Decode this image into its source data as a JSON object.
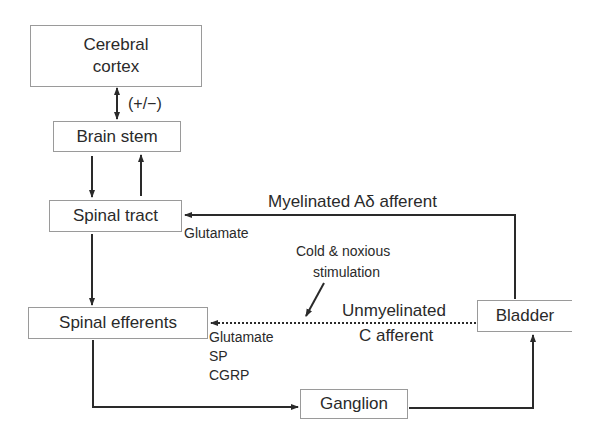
{
  "diagram": {
    "nodes": {
      "cerebral_cortex": {
        "label_line1": "Cerebral",
        "label_line2": "cortex"
      },
      "brain_stem": {
        "label": "Brain stem"
      },
      "spinal_tract": {
        "label": "Spinal tract"
      },
      "spinal_efferents": {
        "label": "Spinal efferents"
      },
      "bladder": {
        "label": "Bladder"
      },
      "ganglion": {
        "label": "Ganglion"
      }
    },
    "annotations": {
      "modulation": "(+/−)",
      "myelinated": "Myelinated Aδ afferent",
      "glutamate_tract": "Glutamate",
      "cold_line1": "Cold & noxious",
      "cold_line2": "stimulation",
      "unmyelinated_line1": "Unmyelinated",
      "unmyelinated_line2": "C afferent",
      "neurotransmitters": [
        "Glutamate",
        "SP",
        "CGRP"
      ]
    },
    "edges": [
      {
        "from": "cerebral_cortex",
        "to": "brain_stem",
        "style": "solid",
        "direction": "bidirectional",
        "label": "(+/−)"
      },
      {
        "from": "brain_stem",
        "to": "spinal_tract",
        "style": "solid"
      },
      {
        "from": "spinal_tract",
        "to": "brain_stem",
        "style": "solid"
      },
      {
        "from": "spinal_tract",
        "to": "spinal_efferents",
        "style": "solid"
      },
      {
        "from": "bladder",
        "to": "spinal_tract",
        "style": "solid",
        "label": "Myelinated Aδ afferent"
      },
      {
        "from": "bladder",
        "to": "spinal_efferents",
        "style": "dotted",
        "label": "Unmyelinated C afferent"
      },
      {
        "from": "spinal_efferents",
        "to": "ganglion",
        "style": "solid"
      },
      {
        "from": "ganglion",
        "to": "bladder",
        "style": "solid"
      }
    ],
    "colors": {
      "line": "#2a2a2a",
      "box_border": "#9a9a9a",
      "text": "#2a2a2a"
    }
  }
}
